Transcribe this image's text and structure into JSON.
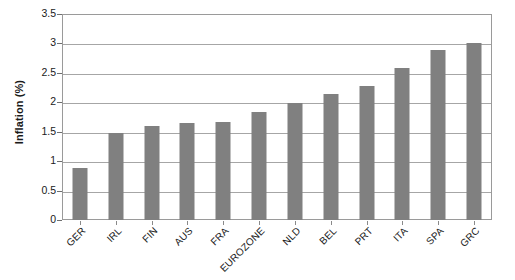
{
  "chart_data": {
    "type": "bar",
    "title": "",
    "subtitle": "",
    "xlabel": "",
    "ylabel": "Inflation (%)",
    "categories": [
      "GER",
      "IRL",
      "FIN",
      "AUS",
      "FRA",
      "EUROZONE",
      "NLD",
      "BEL",
      "PRT",
      "ITA",
      "SPA",
      "GRC"
    ],
    "values": [
      0.89,
      1.47,
      1.6,
      1.65,
      1.67,
      1.84,
      1.99,
      2.14,
      2.27,
      2.58,
      2.89,
      3.01
    ],
    "ylim": [
      0,
      3.5
    ],
    "yticks": [
      0,
      0.5,
      1,
      1.5,
      2,
      2.5,
      3,
      3.5
    ],
    "ytick_labels": [
      "0",
      "0.5",
      "1",
      "1.5",
      "2",
      "2.5",
      "3",
      "3.5"
    ],
    "grid": true,
    "grid_axis": "y",
    "legend": false,
    "legend_position": "none",
    "series": [
      {
        "name": "Inflation (%)",
        "color": "#808080",
        "values": [
          0.89,
          1.47,
          1.6,
          1.65,
          1.67,
          1.84,
          1.99,
          2.14,
          2.27,
          2.58,
          2.89,
          3.01
        ]
      }
    ],
    "bar_color": "#808080",
    "plot_border_color": "#9a9a9a",
    "gridline_color": "#a6a6a6",
    "background_color": "#ffffff",
    "text_color": "#1a1a1a",
    "xtick_label_rotation": -45
  }
}
